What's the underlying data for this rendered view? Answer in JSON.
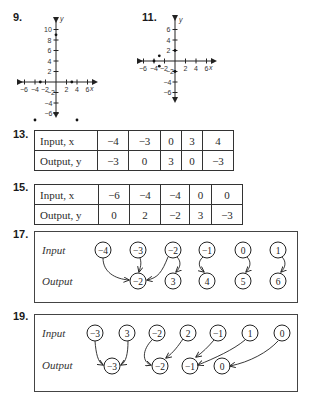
{
  "problems": {
    "p9": {
      "label": "9.",
      "graph": {
        "x_axis_label": "x",
        "y_axis_label": "y",
        "x_ticks": [
          "−6",
          "−4",
          "−2",
          "2",
          "4",
          "6"
        ],
        "y_ticks": [
          "10",
          "8",
          "6",
          "4",
          "2",
          "−2",
          "−4",
          "−6"
        ],
        "points": [
          [
            0,
            9
          ],
          [
            -3,
            0
          ],
          [
            3,
            0
          ],
          [
            -4,
            -8
          ],
          [
            4,
            -8
          ]
        ]
      }
    },
    "p11": {
      "label": "11.",
      "graph": {
        "x_axis_label": "x",
        "y_axis_label": "y",
        "x_ticks": [
          "−6",
          "−4",
          "−2",
          "2",
          "4",
          "6"
        ],
        "y_ticks": [
          "6",
          "4",
          "2",
          "−2",
          "−4",
          "−6"
        ],
        "points": [
          [
            -4,
            0
          ],
          [
            -3,
            1
          ],
          [
            -3,
            -1
          ],
          [
            0,
            2
          ],
          [
            0,
            -2
          ]
        ]
      }
    },
    "p13": {
      "label": "13.",
      "table": {
        "input_header": "Input, x",
        "output_header": "Output, y",
        "inputs": [
          "−4",
          "−3",
          "0",
          "3",
          "4"
        ],
        "outputs": [
          "−3",
          "0",
          "3",
          "0",
          "−3"
        ]
      }
    },
    "p15": {
      "label": "15.",
      "table": {
        "input_header": "Input, x",
        "output_header": "Output, y",
        "inputs": [
          "−6",
          "−4",
          "−4",
          "0",
          "0"
        ],
        "outputs": [
          "0",
          "2",
          "−2",
          "3",
          "−3"
        ]
      }
    },
    "p17": {
      "label": "17.",
      "mapping": {
        "input_label": "Input",
        "output_label": "Output",
        "inputs": [
          "−4",
          "−3",
          "−2",
          "−1",
          "0",
          "1"
        ],
        "outputs": [
          "−2",
          "3",
          "4",
          "5",
          "6"
        ],
        "arrows": [
          [
            "−4",
            "−2"
          ],
          [
            "−3",
            "−2"
          ],
          [
            "−2",
            "−2"
          ],
          [
            "−2",
            "3"
          ],
          [
            "−1",
            "4"
          ],
          [
            "0",
            "5"
          ],
          [
            "1",
            "6"
          ]
        ]
      }
    },
    "p19": {
      "label": "19.",
      "mapping": {
        "input_label": "Input",
        "output_label": "Output",
        "inputs": [
          "−3",
          "3",
          "−2",
          "2",
          "−1",
          "1",
          "0"
        ],
        "outputs": [
          "−3",
          "−2",
          "−1",
          "0"
        ],
        "arrows": [
          [
            "−3",
            "−3"
          ],
          [
            "3",
            "−3"
          ],
          [
            "−2",
            "−2"
          ],
          [
            "2",
            "−2"
          ],
          [
            "−1",
            "−1"
          ],
          [
            "1",
            "−1"
          ],
          [
            "0",
            "0"
          ]
        ]
      }
    }
  }
}
